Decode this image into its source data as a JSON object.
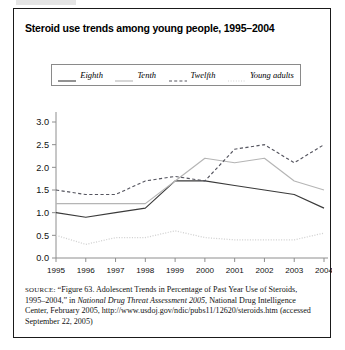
{
  "figure": {
    "title": "Steroid use trends among young people, 1995–2004",
    "border_color": "#1a1a1a"
  },
  "legend": {
    "items": [
      {
        "label": "Eighth",
        "style": "solid",
        "color": "#3a3a3a",
        "name": "legend-item-eighth"
      },
      {
        "label": "Tenth",
        "style": "solid",
        "color": "#b5b5b5",
        "name": "legend-item-tenth"
      },
      {
        "label": "Twelfth",
        "style": "dashed",
        "color": "#55555f",
        "name": "legend-item-twelfth"
      },
      {
        "label": "Young adults",
        "style": "dotted",
        "color": "#d2d2d2",
        "name": "legend-item-young-adults"
      }
    ]
  },
  "source": {
    "prefix": "SOURCE:",
    "part1": " “Figure 63. Adolescent Trends in Percentage of Past Year Use of Steroids, 1995–2004,” in ",
    "italic": "National Drug Threat Assessment 2005",
    "part2": ", National Drug Intelligence Center, February 2005, http://www.usdoj.gov/ndic/pubs11/12620/steroids.htm (accessed September 22, 2005)"
  },
  "chart_data": {
    "type": "line",
    "title": "Steroid use trends among young people, 1995–2004",
    "xlabel": "",
    "ylabel": "",
    "x": [
      1995,
      1996,
      1997,
      1998,
      1999,
      2000,
      2001,
      2002,
      2003,
      2004
    ],
    "xtick_labels": [
      "1995",
      "1996",
      "1997",
      "1998",
      "1999",
      "2000",
      "2001",
      "2002",
      "2003",
      "2004"
    ],
    "ytick_labels": [
      "0.0",
      "0.5",
      "1.0",
      "1.5",
      "2.0",
      "2.5",
      "3.0"
    ],
    "yticks": [
      0.0,
      0.5,
      1.0,
      1.5,
      2.0,
      2.5,
      3.0
    ],
    "ylim": [
      0.0,
      3.0
    ],
    "xlim": [
      1995,
      2004
    ],
    "grid": false,
    "legend_position": "top",
    "series": [
      {
        "name": "Eighth",
        "style": "solid",
        "color": "#3a3a3a",
        "values": [
          1.0,
          0.9,
          1.0,
          1.1,
          1.7,
          1.7,
          1.6,
          1.5,
          1.4,
          1.1
        ]
      },
      {
        "name": "Tenth",
        "style": "solid",
        "color": "#b5b5b5",
        "values": [
          1.2,
          1.2,
          1.2,
          1.2,
          1.7,
          2.2,
          2.1,
          2.2,
          1.7,
          1.5
        ]
      },
      {
        "name": "Twelfth",
        "style": "dashed",
        "color": "#55555f",
        "values": [
          1.5,
          1.4,
          1.4,
          1.7,
          1.8,
          1.7,
          2.4,
          2.5,
          2.1,
          2.5
        ]
      },
      {
        "name": "Young adults",
        "style": "dotted",
        "color": "#d2d2d2",
        "values": [
          0.5,
          0.3,
          0.45,
          0.45,
          0.6,
          0.45,
          0.4,
          0.4,
          0.4,
          0.55
        ]
      }
    ]
  }
}
